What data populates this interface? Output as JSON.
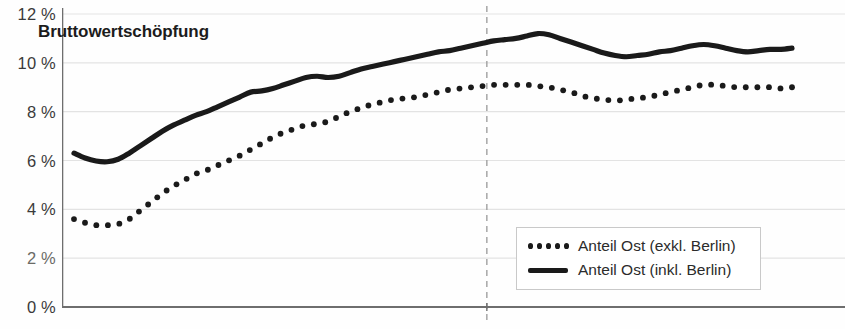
{
  "chart_data": {
    "type": "line",
    "title": "Bruttowertschöpfung",
    "xlabel": "",
    "ylabel": "",
    "ylim": [
      0,
      12
    ],
    "yticks": [
      0,
      2,
      4,
      6,
      8,
      10,
      12
    ],
    "ytick_labels": [
      "0 %",
      "2 %",
      "4 %",
      "6 %",
      "8 %",
      "10 %",
      "12 %"
    ],
    "grid": true,
    "legend_position": "bottom-right",
    "annotations": [
      {
        "type": "vline",
        "style": "dashed",
        "x_fraction": 0.575,
        "color": "#a0a0a0"
      }
    ],
    "series": [
      {
        "name": "Anteil Ost (exkl. Berlin)",
        "style": "dotted",
        "color": "#1a1a1a",
        "values": [
          3.6,
          3.45,
          3.35,
          3.35,
          3.4,
          3.6,
          3.95,
          4.3,
          4.65,
          4.95,
          5.2,
          5.45,
          5.6,
          5.8,
          6.0,
          6.2,
          6.45,
          6.7,
          6.95,
          7.15,
          7.3,
          7.45,
          7.5,
          7.6,
          7.8,
          8.0,
          8.15,
          8.3,
          8.4,
          8.5,
          8.55,
          8.6,
          8.7,
          8.8,
          8.9,
          8.95,
          9.0,
          9.05,
          9.1,
          9.1,
          9.1,
          9.1,
          9.05,
          9.0,
          8.9,
          8.8,
          8.65,
          8.55,
          8.5,
          8.45,
          8.5,
          8.55,
          8.6,
          8.7,
          8.8,
          8.9,
          9.0,
          9.1,
          9.1,
          9.05,
          9.0,
          9.0,
          9.0,
          9.0,
          8.95,
          9.0
        ]
      },
      {
        "name": "Anteil Ost (inkl. Berlin)",
        "style": "solid",
        "color": "#1a1a1a",
        "values": [
          6.3,
          6.1,
          5.98,
          5.95,
          6.05,
          6.3,
          6.6,
          6.9,
          7.2,
          7.45,
          7.65,
          7.85,
          8.0,
          8.2,
          8.4,
          8.6,
          8.8,
          8.85,
          8.95,
          9.1,
          9.25,
          9.4,
          9.45,
          9.4,
          9.45,
          9.6,
          9.75,
          9.85,
          9.95,
          10.05,
          10.15,
          10.25,
          10.35,
          10.45,
          10.5,
          10.6,
          10.7,
          10.8,
          10.9,
          10.95,
          11.0,
          11.1,
          11.2,
          11.15,
          11.0,
          10.85,
          10.7,
          10.55,
          10.4,
          10.3,
          10.25,
          10.3,
          10.35,
          10.45,
          10.5,
          10.6,
          10.7,
          10.75,
          10.7,
          10.6,
          10.5,
          10.45,
          10.5,
          10.55,
          10.55,
          10.6
        ]
      }
    ]
  },
  "legend": {
    "items": [
      {
        "label": "Anteil Ost (exkl. Berlin)",
        "marker": "dotted-marker"
      },
      {
        "label": "Anteil Ost (inkl. Berlin)",
        "marker": "solid-line-marker"
      }
    ]
  },
  "bottom_strip": {
    "clipped_text": ""
  },
  "colors": {
    "series": "#1a1a1a",
    "grid": "#e3e3e3",
    "axis": "#6e6e6e",
    "dashed_marker": "#a8a8a8",
    "text": "#2b2b2b"
  }
}
